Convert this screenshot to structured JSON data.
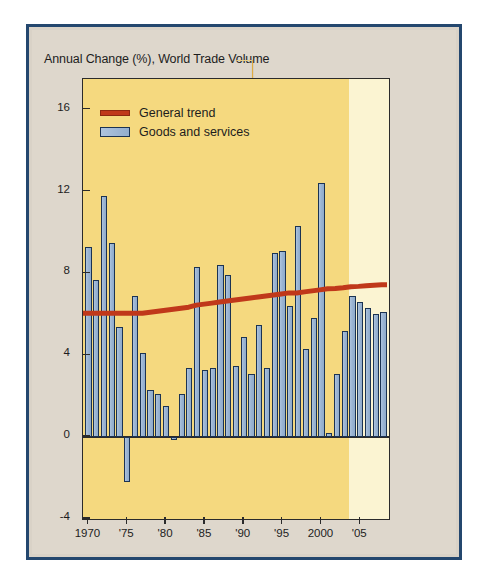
{
  "chart_data": {
    "type": "bar",
    "title": "Annual Change (%), World Trade Volume",
    "xlabel": "",
    "ylabel": "",
    "ylim": [
      -4,
      17.5
    ],
    "xlim": [
      1969.3,
      2008.7
    ],
    "grid": false,
    "legend_position": "top-left",
    "y_ticks": [
      -4,
      0,
      4,
      8,
      12,
      16
    ],
    "y_tick_labels": [
      "-4",
      "0",
      "4",
      "8",
      "12",
      "16"
    ],
    "x_ticks": [
      1970,
      1975,
      1980,
      1985,
      1990,
      1995,
      2000,
      2005
    ],
    "x_tick_labels": [
      "1970",
      "'75",
      "'80",
      "'85",
      "'90",
      "'95",
      "2000",
      "'05"
    ],
    "categories": [
      1970,
      1971,
      1972,
      1973,
      1974,
      1975,
      1976,
      1977,
      1978,
      1979,
      1980,
      1981,
      1982,
      1983,
      1984,
      1985,
      1986,
      1987,
      1988,
      1989,
      1990,
      1991,
      1992,
      1993,
      1994,
      1995,
      1996,
      1997,
      1998,
      1999,
      2000,
      2001,
      2002,
      2003,
      2004,
      2005,
      2006,
      2007,
      2008
    ],
    "series": [
      {
        "name": "Goods and services",
        "type": "bar",
        "color": "#9ab4d2",
        "edge_color": "#1b3352",
        "values": [
          9.3,
          7.7,
          11.8,
          9.5,
          5.4,
          -2.2,
          6.9,
          4.1,
          2.3,
          2.1,
          1.5,
          -0.1,
          2.1,
          3.4,
          8.3,
          3.3,
          3.4,
          8.4,
          7.9,
          3.5,
          4.9,
          3.1,
          5.5,
          3.4,
          9.0,
          9.1,
          6.4,
          10.3,
          4.3,
          5.8,
          12.4,
          0.2,
          3.1,
          5.2,
          6.9,
          6.6,
          6.3,
          6.0,
          6.1
        ]
      },
      {
        "name": "General trend",
        "type": "line",
        "color": "#c0381a",
        "values": [
          6.0,
          6.0,
          6.0,
          6.0,
          6.0,
          6.0,
          6.0,
          6.0,
          6.05,
          6.1,
          6.15,
          6.2,
          6.25,
          6.3,
          6.4,
          6.45,
          6.5,
          6.55,
          6.6,
          6.65,
          6.7,
          6.75,
          6.8,
          6.85,
          6.9,
          6.95,
          7.0,
          7.0,
          7.05,
          7.1,
          7.15,
          7.2,
          7.22,
          7.25,
          7.3,
          7.32,
          7.35,
          7.38,
          7.4
        ]
      }
    ],
    "annotations": [
      {
        "name": "forecast-shading",
        "from": 2003.5,
        "to": 2008.7,
        "label": "",
        "color": "#fbf4d2"
      },
      {
        "name": "historical-shading",
        "from": 1969.3,
        "to": 2003.5,
        "label": "",
        "color": "#f5d97f"
      }
    ]
  },
  "legend": {
    "items": [
      {
        "label": "General trend",
        "swatch": "line-swatch",
        "color": "#c0381a"
      },
      {
        "label": "Goods and services",
        "swatch": "bar-swatch",
        "color": "#9ab4d2"
      }
    ]
  },
  "colors": {
    "bar_fill": "#9ab4d2",
    "bar_edge": "#1b3352",
    "trend_line": "#c0381a",
    "plot_background_historical": "#f5d97f",
    "plot_background_forecast": "#fbf4d2",
    "slab_side": "#f0b53c",
    "page_background": "#ded7cc",
    "outer_border": "#24476e",
    "text": "#1d1d1d"
  }
}
